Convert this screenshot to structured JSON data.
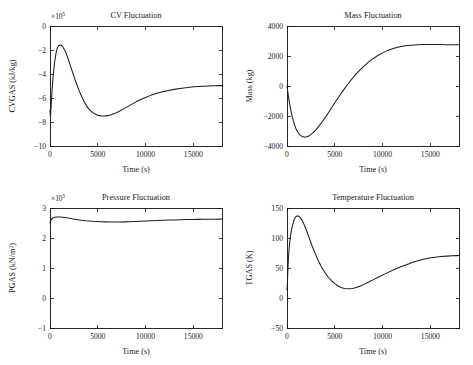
{
  "figure": {
    "layout": "2x2 subplot grid",
    "background_color": "#ffffff",
    "line_color": "#1c1c1c"
  },
  "chart_data": [
    {
      "type": "line",
      "title": "CV Fluctuation",
      "xlabel": "Time (s)",
      "ylabel": "CVGAS (kJ/kg)",
      "y_exponent_label": "×10",
      "y_exponent_power": "5",
      "y_scale": 100000,
      "xlim": [
        0,
        18000
      ],
      "ylim": [
        -10,
        0
      ],
      "xticks": [
        0,
        5000,
        10000,
        15000
      ],
      "yticks": [
        0,
        -2,
        -4,
        -6,
        -8,
        -10
      ],
      "xtick_labels": [
        "0",
        "5000",
        "10000",
        "15000"
      ],
      "ytick_labels": [
        "0",
        "−2",
        "−4",
        "−6",
        "−8",
        "−10"
      ],
      "grid": false,
      "legend": "none",
      "x": [
        0,
        30,
        60,
        100,
        150,
        200,
        260,
        320,
        400,
        500,
        620,
        760,
        900,
        1050,
        1200,
        1350,
        1500,
        1700,
        1900,
        2150,
        2400,
        2700,
        3000,
        3300,
        3600,
        3950,
        4300,
        4650,
        5000,
        5350,
        5700,
        6050,
        6400,
        6800,
        7200,
        7600,
        8000,
        8500,
        9000,
        9500,
        10000,
        10600,
        11200,
        11800,
        12400,
        13000,
        13600,
        14200,
        14800,
        15400,
        16000,
        16600,
        17200,
        17700,
        18000
      ],
      "values": [
        -7.0,
        -7.5,
        -7.4,
        -6.9,
        -6.2,
        -5.6,
        -4.9,
        -4.3,
        -3.6,
        -2.9,
        -2.3,
        -1.85,
        -1.65,
        -1.58,
        -1.62,
        -1.75,
        -1.95,
        -2.3,
        -2.75,
        -3.35,
        -3.95,
        -4.65,
        -5.3,
        -5.85,
        -6.35,
        -6.8,
        -7.1,
        -7.32,
        -7.44,
        -7.49,
        -7.5,
        -7.47,
        -7.4,
        -7.28,
        -7.12,
        -6.95,
        -6.78,
        -6.55,
        -6.32,
        -6.12,
        -5.95,
        -5.76,
        -5.6,
        -5.48,
        -5.37,
        -5.28,
        -5.2,
        -5.14,
        -5.09,
        -5.05,
        -5.02,
        -5.0,
        -4.98,
        -4.97,
        -4.97
      ]
    },
    {
      "type": "line",
      "title": "Mass Fluctuation",
      "xlabel": "Time (s)",
      "ylabel": "Mass (kg)",
      "y_exponent_label": "",
      "y_exponent_power": "",
      "y_scale": 1,
      "xlim": [
        0,
        18000
      ],
      "ylim": [
        -4000,
        4000
      ],
      "xticks": [
        0,
        5000,
        10000,
        15000
      ],
      "yticks": [
        4000,
        2000,
        0,
        -2000,
        -4000
      ],
      "xtick_labels": [
        "0",
        "5000",
        "10000",
        "15000"
      ],
      "ytick_labels": [
        "4000",
        "2000",
        "0",
        "−2000",
        "−4000"
      ],
      "grid": false,
      "legend": "none",
      "x": [
        0,
        40,
        90,
        150,
        220,
        300,
        400,
        520,
        660,
        820,
        1000,
        1200,
        1400,
        1600,
        1800,
        2000,
        2200,
        2450,
        2700,
        3000,
        3300,
        3650,
        4000,
        4400,
        4800,
        5200,
        5600,
        6000,
        6400,
        6800,
        7200,
        7600,
        8000,
        8500,
        9000,
        9500,
        10000,
        10600,
        11200,
        11800,
        12400,
        13000,
        13600,
        14200,
        14800,
        15400,
        16000,
        16600,
        17200,
        17700,
        18000
      ],
      "values": [
        0,
        -180,
        -420,
        -700,
        -980,
        -1280,
        -1620,
        -1980,
        -2320,
        -2650,
        -2930,
        -3150,
        -3290,
        -3370,
        -3400,
        -3395,
        -3355,
        -3260,
        -3130,
        -2940,
        -2710,
        -2420,
        -2110,
        -1720,
        -1320,
        -930,
        -550,
        -190,
        150,
        470,
        770,
        1040,
        1290,
        1570,
        1820,
        2030,
        2210,
        2390,
        2520,
        2610,
        2680,
        2720,
        2745,
        2760,
        2765,
        2765,
        2760,
        2755,
        2750,
        2748,
        2747
      ]
    },
    {
      "type": "line",
      "title": "Pressure Fluctuation",
      "xlabel": "Time (s)",
      "ylabel": "PGAS (kN/m²)",
      "ylabel_base": "PGAS (kN/m",
      "ylabel_sup": "2",
      "ylabel_tail": ")",
      "y_exponent_label": "×10",
      "y_exponent_power": "5",
      "y_scale": 100000,
      "xlim": [
        0,
        18000
      ],
      "ylim": [
        -1,
        3
      ],
      "xticks": [
        0,
        5000,
        10000,
        15000
      ],
      "yticks": [
        3,
        2,
        1,
        0,
        -1
      ],
      "xtick_labels": [
        "0",
        "5000",
        "10000",
        "15000"
      ],
      "ytick_labels": [
        "3",
        "2",
        "1",
        "0",
        "−1"
      ],
      "grid": false,
      "legend": "none",
      "x": [
        0,
        50,
        120,
        220,
        350,
        500,
        680,
        880,
        1100,
        1350,
        1600,
        1900,
        2200,
        2550,
        2900,
        3300,
        3700,
        4100,
        4500,
        4900,
        5300,
        5800,
        6300,
        6800,
        7300,
        7800,
        8300,
        8900,
        9500,
        10100,
        10700,
        11300,
        11900,
        12500,
        13100,
        13700,
        14300,
        14900,
        15500,
        16100,
        16700,
        17300,
        17700,
        18000
      ],
      "values": [
        2.5,
        2.56,
        2.61,
        2.65,
        2.675,
        2.69,
        2.697,
        2.7,
        2.697,
        2.69,
        2.68,
        2.665,
        2.648,
        2.628,
        2.61,
        2.592,
        2.577,
        2.565,
        2.555,
        2.548,
        2.542,
        2.537,
        2.534,
        2.533,
        2.534,
        2.537,
        2.541,
        2.548,
        2.556,
        2.565,
        2.574,
        2.582,
        2.59,
        2.597,
        2.603,
        2.609,
        2.614,
        2.618,
        2.621,
        2.624,
        2.626,
        2.628,
        2.629,
        2.63
      ]
    },
    {
      "type": "line",
      "title": "Temperature Fluctuation",
      "xlabel": "Time (s)",
      "ylabel": "TGAS (K)",
      "y_exponent_label": "",
      "y_exponent_power": "",
      "y_scale": 1,
      "xlim": [
        0,
        18000
      ],
      "ylim": [
        -50,
        150
      ],
      "xticks": [
        0,
        5000,
        10000,
        15000
      ],
      "yticks": [
        150,
        100,
        50,
        0,
        -50
      ],
      "xtick_labels": [
        "0",
        "5000",
        "10000",
        "15000"
      ],
      "ytick_labels": [
        "150",
        "100",
        "50",
        "0",
        "−50"
      ],
      "grid": false,
      "legend": "none",
      "x": [
        0,
        30,
        60,
        100,
        150,
        210,
        280,
        360,
        450,
        560,
        680,
        820,
        960,
        1100,
        1250,
        1400,
        1600,
        1800,
        2050,
        2300,
        2600,
        2900,
        3250,
        3600,
        3950,
        4300,
        4650,
        5000,
        5350,
        5700,
        6050,
        6450,
        6850,
        7250,
        7700,
        8150,
        8600,
        9100,
        9600,
        10100,
        10700,
        11300,
        11900,
        12500,
        13100,
        13700,
        14300,
        14900,
        15500,
        16100,
        16700,
        17300,
        17700,
        18000
      ],
      "values": [
        14,
        20,
        33,
        50,
        66,
        80,
        93,
        103,
        112,
        120,
        127,
        133,
        136,
        137,
        136,
        134,
        129,
        122,
        112,
        101,
        88,
        76,
        63,
        52,
        43,
        35,
        29,
        24,
        20,
        17,
        16,
        15.5,
        16,
        17.5,
        20,
        23.5,
        27,
        31,
        35,
        39,
        43.5,
        48,
        52,
        55.5,
        59,
        62,
        64.5,
        66.5,
        68,
        69,
        69.8,
        70.3,
        70.6,
        70.8
      ]
    }
  ]
}
